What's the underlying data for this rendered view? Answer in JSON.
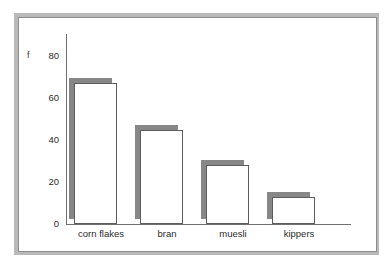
{
  "chart_data": {
    "type": "bar",
    "title": "",
    "subtitle": "",
    "xlabel": "",
    "ylabel": "f",
    "categories": [
      "corn flakes",
      "bran",
      "muesli",
      "kippers"
    ],
    "values": [
      67,
      45,
      28,
      13
    ],
    "ylim": [
      0,
      80
    ],
    "y_ticks": [
      0,
      20,
      40,
      60,
      80
    ],
    "y_tick_labels": [
      "0",
      "20",
      "40",
      "60",
      "80"
    ],
    "grid": false,
    "legend": null,
    "annotations": [],
    "series": [
      {
        "name": "frequency",
        "values": [
          67,
          45,
          28,
          13
        ]
      }
    ],
    "style": {
      "bar_face_color": "#ffffff",
      "bar_edge_color": "#5d5d5d",
      "bar_shadow_color": "#878787",
      "axis_color": "#6f6f6f",
      "frame_color": "#8d8d8d",
      "frame_shadow_color": "#b9b9b9",
      "background": "#ffffff"
    }
  }
}
